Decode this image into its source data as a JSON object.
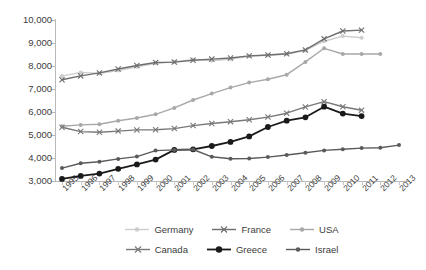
{
  "chart_data": {
    "type": "line",
    "title": "",
    "xlabel": "",
    "ylabel": "",
    "ylim": [
      3000,
      10000
    ],
    "ytick_step": 1000,
    "grid": false,
    "legend_position": "bottom",
    "x": [
      "1995",
      "1996",
      "1997",
      "1998",
      "1999",
      "2000",
      "2001",
      "2002",
      "2003",
      "2004",
      "2005",
      "2006",
      "2007",
      "2008",
      "2009",
      "2010",
      "2011",
      "2012",
      "2013"
    ],
    "ytick_labels": [
      "3,000",
      "4,000",
      "5,000",
      "6,000",
      "7,000",
      "8,000",
      "9,000",
      "10,000"
    ],
    "ytick_values": [
      3000,
      4000,
      5000,
      6000,
      7000,
      8000,
      9000,
      10000
    ],
    "series": [
      {
        "name": "Germany",
        "color": "#cdcdcd",
        "marker": "circle",
        "values": [
          7560,
          7720,
          7680,
          7800,
          7970,
          8120,
          8180,
          8280,
          8230,
          8300,
          8420,
          8470,
          8520,
          8680,
          9080,
          9300,
          9230,
          null,
          null
        ]
      },
      {
        "name": "France",
        "color": "#6e6e6e",
        "marker": "cross",
        "values": [
          7400,
          7570,
          7700,
          7870,
          8020,
          8150,
          8170,
          8250,
          8300,
          8350,
          8440,
          8480,
          8530,
          8700,
          9180,
          9520,
          9560,
          null,
          null
        ]
      },
      {
        "name": "USA",
        "color": "#a8a8a8",
        "marker": "circle",
        "values": [
          5380,
          5440,
          5470,
          5620,
          5740,
          5900,
          6180,
          6520,
          6800,
          7060,
          7280,
          7420,
          7620,
          8180,
          8770,
          8520,
          8520,
          8520,
          null
        ]
      },
      {
        "name": "Canada",
        "color": "#787878",
        "marker": "cross",
        "values": [
          5340,
          5150,
          5120,
          5170,
          5220,
          5230,
          5280,
          5410,
          5500,
          5580,
          5660,
          5780,
          5950,
          6220,
          6450,
          6230,
          6080,
          null,
          null
        ]
      },
      {
        "name": "Greece",
        "color": "#1a1a1a",
        "marker": "circle-large",
        "values": [
          3090,
          3220,
          3320,
          3530,
          3720,
          3930,
          4350,
          4380,
          4520,
          4700,
          4940,
          5350,
          5620,
          5770,
          6230,
          5930,
          5820,
          null,
          null
        ]
      },
      {
        "name": "Israel",
        "color": "#5a5a5a",
        "marker": "circle",
        "values": [
          3560,
          3770,
          3840,
          3960,
          4060,
          4320,
          4350,
          4370,
          4050,
          3970,
          3980,
          4040,
          4130,
          4230,
          4330,
          4380,
          4430,
          4450,
          4560
        ]
      }
    ]
  },
  "legend": {
    "rows": [
      [
        {
          "label": "Germany"
        },
        {
          "label": "France"
        },
        {
          "label": "USA"
        }
      ],
      [
        {
          "label": "Canada"
        },
        {
          "label": "Greece"
        },
        {
          "label": "Israel"
        }
      ]
    ]
  }
}
